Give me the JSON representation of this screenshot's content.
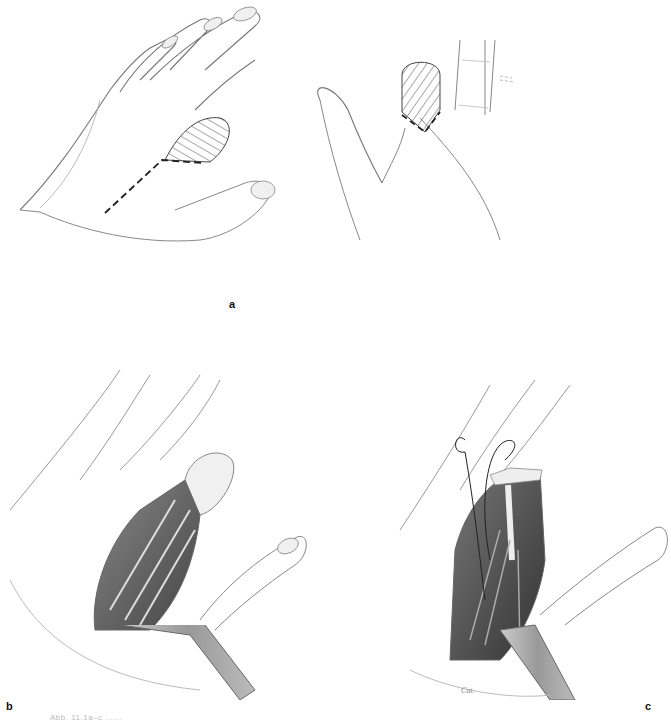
{
  "figure": {
    "panels": [
      {
        "id": "a",
        "label": "a",
        "description": "Dorsal and palmar views of hand; index finger amputation zone hatched with dashed incision line"
      },
      {
        "id": "b",
        "label": "b",
        "description": "Opened incision exposing tendons and interosseous muscles with retractor"
      },
      {
        "id": "c",
        "label": "c",
        "description": "Tendon transfer with sutures passed through middle finger, retractor in place"
      }
    ],
    "signature": "Cut.",
    "caption_partial": "Abb. 11.1a–c  ……"
  }
}
